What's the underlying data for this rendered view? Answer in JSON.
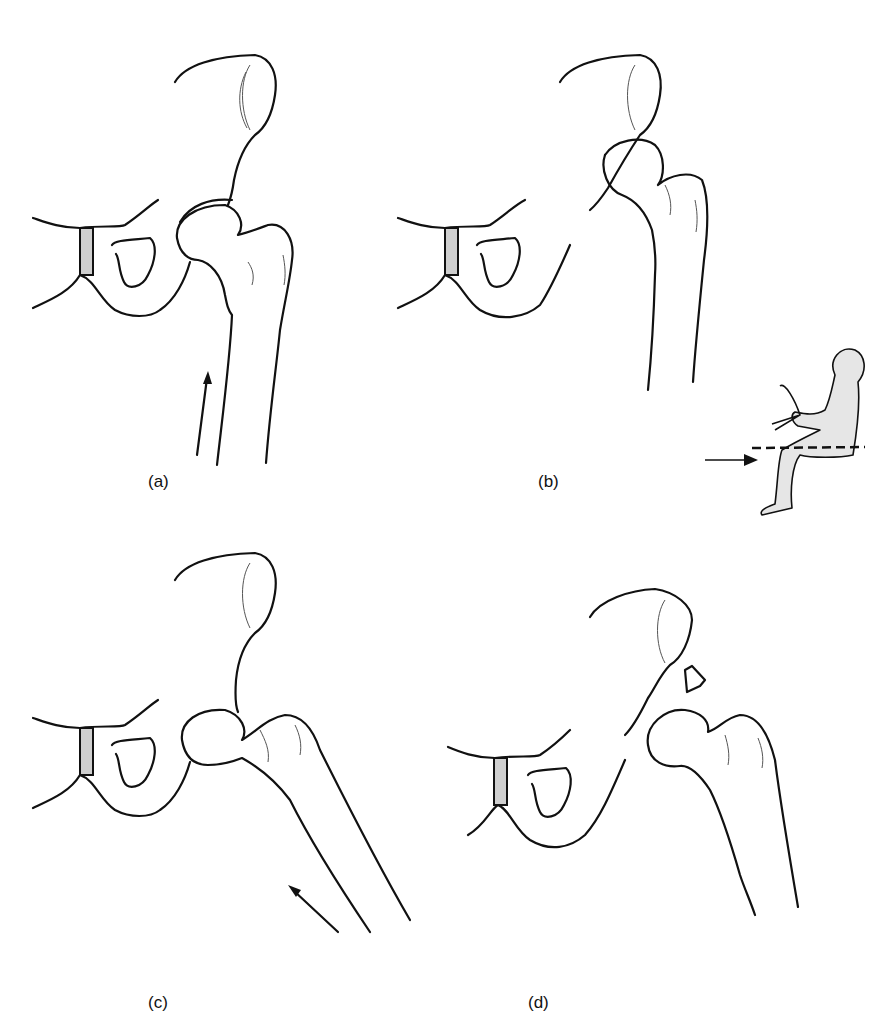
{
  "figure": {
    "panels": [
      {
        "id": "a",
        "label": "(a)",
        "description": "hip joint with femoral head seated in acetabulum, force arrow along femoral shaft"
      },
      {
        "id": "b",
        "label": "(b)",
        "description": "posterior dislocation of femoral head with dashboard-injury inset of seated driver"
      },
      {
        "id": "c",
        "label": "(c)",
        "description": "hip in flexion/abduction with force arrow along femur"
      },
      {
        "id": "d",
        "label": "(d)",
        "description": "dislocation with fracture fragment of acetabular rim"
      }
    ],
    "inset": {
      "name": "seated-driver-inset",
      "fill_color": "#e6e6e6",
      "dashed_line": "knee level line",
      "arrow": "force from front toward knee"
    },
    "colors": {
      "line": "#111111",
      "background": "#ffffff",
      "inset_fill": "#e6e6e6"
    }
  }
}
